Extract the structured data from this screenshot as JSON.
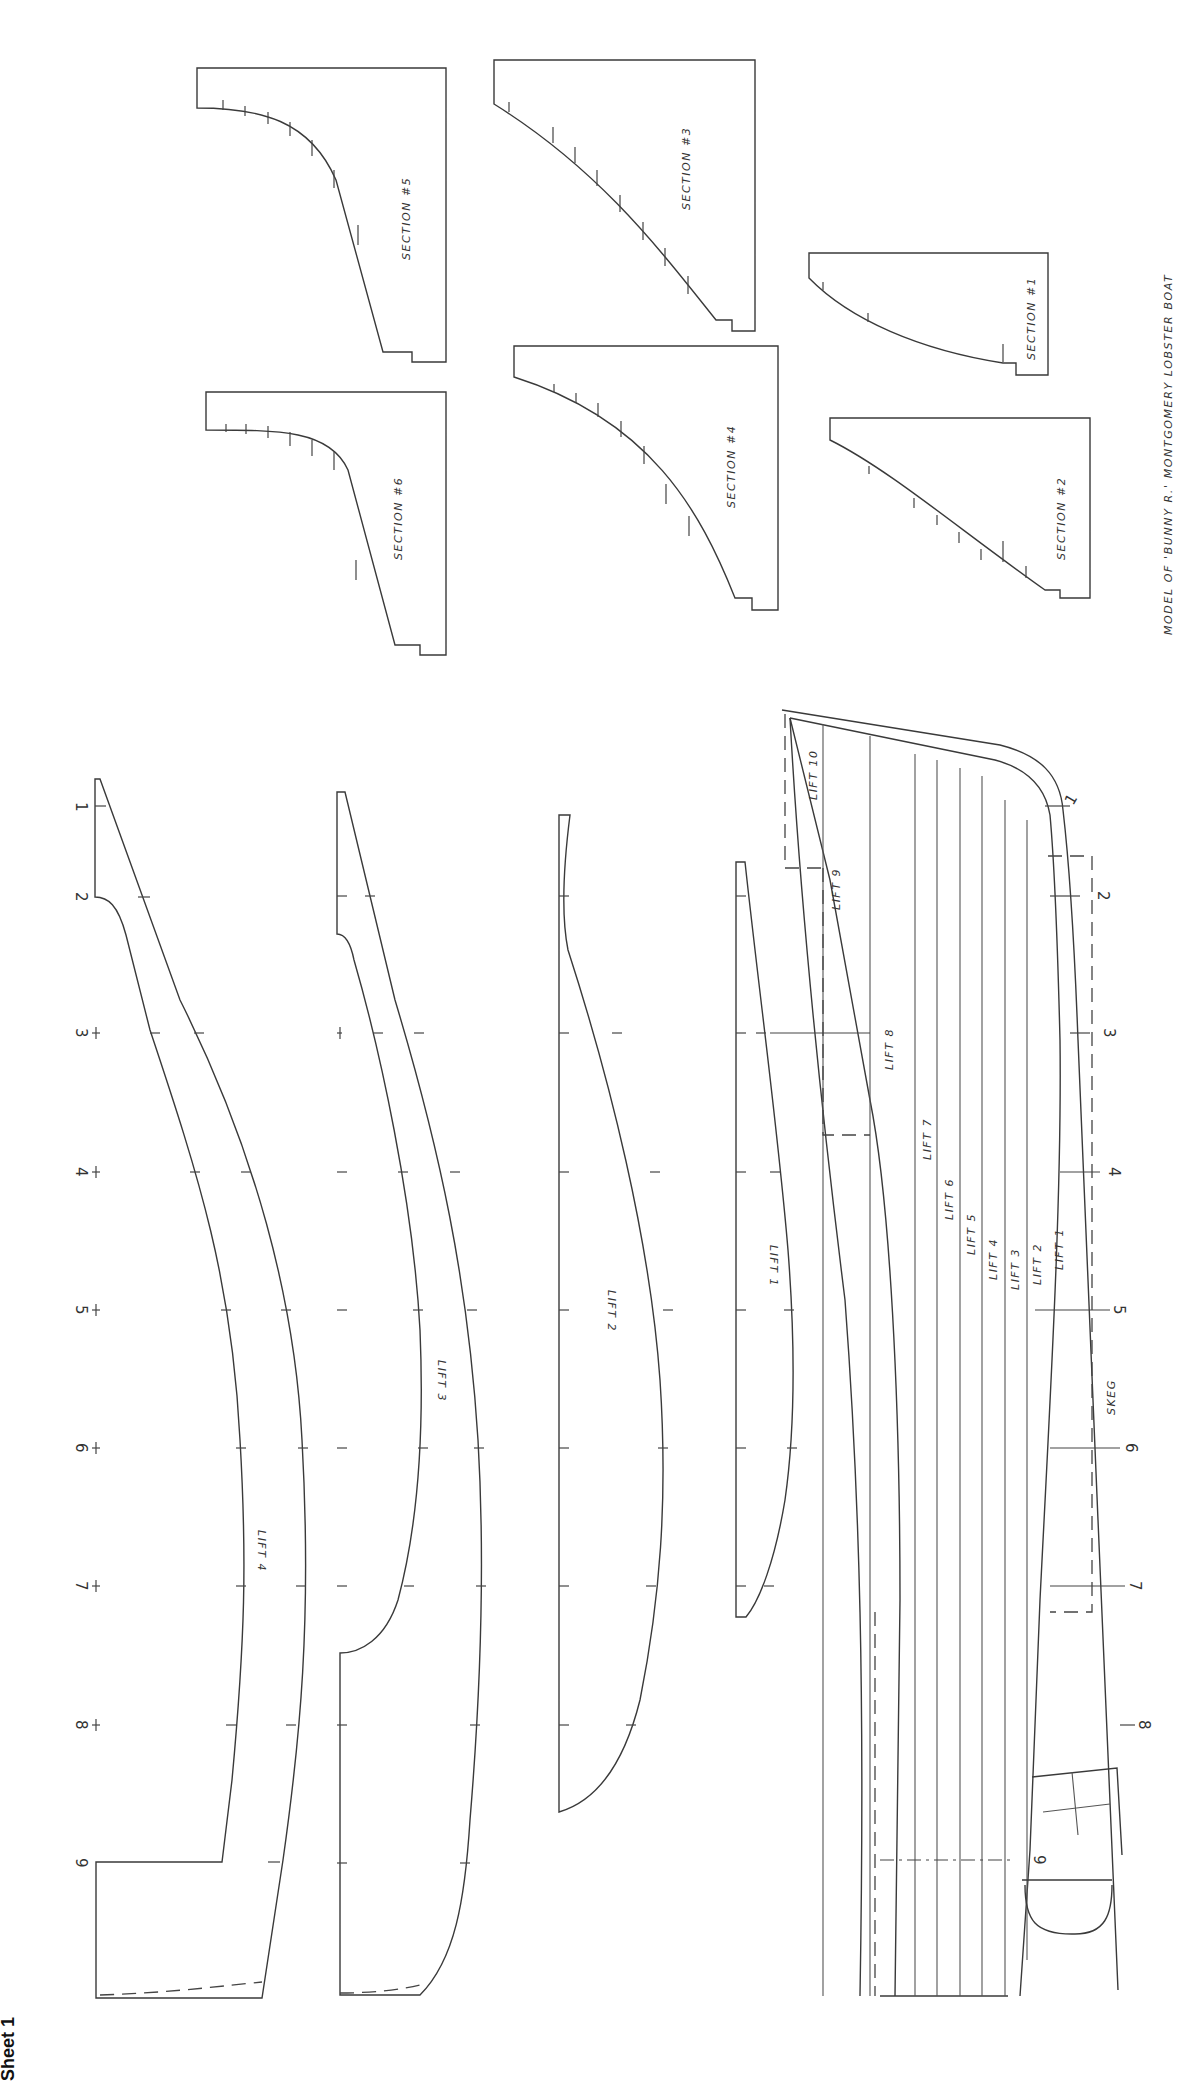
{
  "title": "MODEL OF 'BUNNY R.' MONTGOMERY LOBSTER BOAT",
  "sheet_label": "Sheet 1",
  "stations": [
    "1",
    "2",
    "3",
    "4",
    "5",
    "6",
    "7",
    "8",
    "9"
  ],
  "sections": [
    {
      "id": "s5",
      "label": "SECTION #5"
    },
    {
      "id": "s3",
      "label": "SECTION #3"
    },
    {
      "id": "s6",
      "label": "SECTION #6"
    },
    {
      "id": "s4",
      "label": "SECTION #4"
    },
    {
      "id": "s1",
      "label": "SECTION #1"
    },
    {
      "id": "s2",
      "label": "SECTION #2"
    }
  ],
  "lift_templates": [
    {
      "id": "lift4",
      "label": "LIFT 4"
    },
    {
      "id": "lift3",
      "label": "LIFT 3"
    },
    {
      "id": "lift2",
      "label": "LIFT 2"
    },
    {
      "id": "lift1",
      "label": "LIFT 1"
    }
  ],
  "profile": {
    "lift_labels": [
      "LIFT 10",
      "LIFT 9",
      "LIFT 8",
      "LIFT 7",
      "LIFT 6",
      "LIFT 5",
      "LIFT 4",
      "LIFT 3",
      "LIFT 2",
      "LIFT 1"
    ],
    "skeg_label": "SKEG"
  },
  "colors": {
    "paper": "#ffffff",
    "ink": "#3a3a3a"
  }
}
